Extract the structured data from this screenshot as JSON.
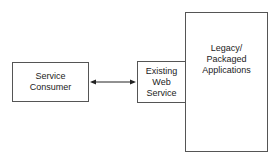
{
  "diagram": {
    "nodes": [
      {
        "id": "service-consumer",
        "label": "Service\nConsumer"
      },
      {
        "id": "existing-web-service",
        "label": "Existing\nWeb\nService"
      },
      {
        "id": "legacy-applications",
        "label": "Legacy/\nPackaged\nApplications"
      }
    ],
    "edges": [
      {
        "from": "service-consumer",
        "to": "existing-web-service",
        "type": "bidirectional-arrow"
      }
    ]
  }
}
